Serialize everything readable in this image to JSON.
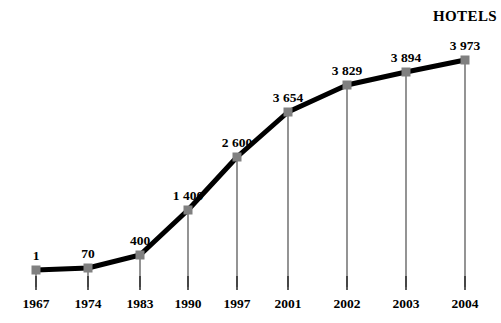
{
  "chart_data": {
    "type": "line",
    "title": "HOTELS",
    "xlabel": "",
    "ylabel": "",
    "grid": false,
    "legend": "none",
    "categories": [
      "1967",
      "1974",
      "1983",
      "1990",
      "1997",
      "2001",
      "2002",
      "2003",
      "2004"
    ],
    "values": [
      1,
      70,
      400,
      1400,
      2600,
      3654,
      3829,
      3894,
      3973
    ],
    "value_labels": [
      "1",
      "70",
      "400",
      "1 400",
      "2 600",
      "3 654",
      "3 829",
      "3 894",
      "3 973"
    ],
    "ylim": [
      0,
      4100
    ],
    "xlim": [
      "1967",
      "2004"
    ],
    "series": [
      {
        "name": "HOTELS",
        "values": [
          1,
          70,
          400,
          1400,
          2600,
          3654,
          3829,
          3894,
          3973
        ]
      }
    ],
    "points": [
      {
        "category": "1967",
        "value": 1,
        "label": "1",
        "px": 36,
        "py": 270
      },
      {
        "category": "1974",
        "value": 70,
        "label": "70",
        "px": 88,
        "py": 268
      },
      {
        "category": "1983",
        "value": 400,
        "label": "400",
        "px": 140,
        "py": 255
      },
      {
        "category": "1990",
        "value": 1400,
        "label": "1 400",
        "px": 188,
        "py": 210
      },
      {
        "category": "1997",
        "value": 2600,
        "label": "2 600",
        "px": 237,
        "py": 157
      },
      {
        "category": "2001",
        "value": 3654,
        "label": "3 654",
        "px": 288,
        "py": 112
      },
      {
        "category": "2002",
        "value": 3829,
        "label": "3 829",
        "px": 347,
        "py": 85
      },
      {
        "category": "2003",
        "value": 3894,
        "label": "3 894",
        "px": 406,
        "py": 72
      },
      {
        "category": "2004",
        "value": 3973,
        "label": "3 973",
        "px": 465,
        "py": 60
      }
    ],
    "colors": {
      "line": "#000000",
      "marker": "#808080",
      "dropline": "#666666",
      "tick": "#333333",
      "text": "#000000",
      "background": "#ffffff"
    },
    "axis": {
      "baseline_y": 287,
      "tick_top_y": 276,
      "tick_bottom_y": 290,
      "label_y": 296
    },
    "title_position": {
      "x": 465,
      "y": 8
    }
  }
}
